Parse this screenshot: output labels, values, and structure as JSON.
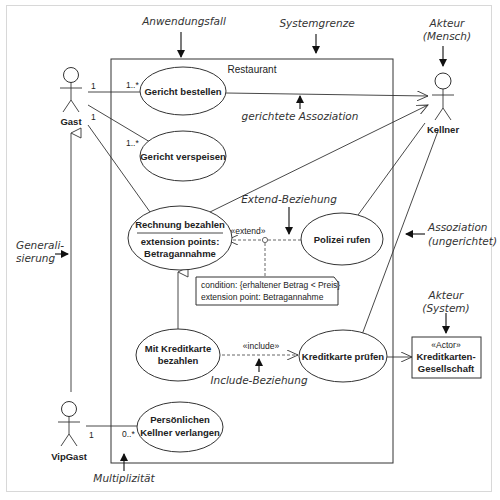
{
  "diagram": {
    "type": "UML use case diagram",
    "system_boundary": {
      "label": "Restaurant"
    },
    "actors": {
      "gast": {
        "label": "Gast"
      },
      "vipgast": {
        "label": "VipGast"
      },
      "kellner": {
        "label": "Kellner"
      },
      "kreditkarten": {
        "stereotype": "«Actor»",
        "line1": "Kreditkarten-",
        "line2": "Gesellschaft"
      }
    },
    "use_cases": {
      "bestellen": {
        "label": "Gericht bestellen"
      },
      "verspeisen": {
        "label": "Gericht verspeisen"
      },
      "rechnung": {
        "label": "Rechnung bezahlen",
        "ext_title": "extension points:",
        "ext_point": "Betragannahme"
      },
      "polizei": {
        "label": "Polizei rufen"
      },
      "kreditkarte_bezahlen": {
        "line1": "Mit Kreditkarte",
        "line2": "bezahlen"
      },
      "kreditkarte_pruefen": {
        "label": "Kreditkarte prüfen"
      },
      "kellner_verlangen": {
        "line1": "Persönlichen",
        "line2": "Kellner verlangen"
      }
    },
    "multiplicities": {
      "gast_bestellen_actor": "1",
      "gast_bestellen_uc": "1..*",
      "gast_verspeisen_actor": "1",
      "gast_verspeisen_uc": "1..*",
      "vip_actor": "1",
      "vip_uc": "0..*"
    },
    "relations": {
      "extend_label": "«extend»",
      "include_label": "«include»"
    },
    "note": {
      "line1": "condition: {erhaltener Betrag < Preis}",
      "line2": "extension point: Betragannahme"
    },
    "annotations": {
      "anwendungsfall": "Anwendungsfall",
      "systemgrenze": "Systemgrenze",
      "akteur_mensch_1": "Akteur",
      "akteur_mensch_2": "(Mensch)",
      "gerichtete_assoziation": "gerichtete Assoziation",
      "extend_beziehung": "Extend-Beziehung",
      "assoziation_1": "Assoziation",
      "assoziation_2": "(ungerichtet)",
      "akteur_system_1": "Akteur",
      "akteur_system_2": "(System)",
      "generalisierung_1": "Generali-",
      "generalisierung_2": "sierung",
      "include_beziehung": "Include-Beziehung",
      "multiplizitaet": "Multiplizität"
    }
  }
}
